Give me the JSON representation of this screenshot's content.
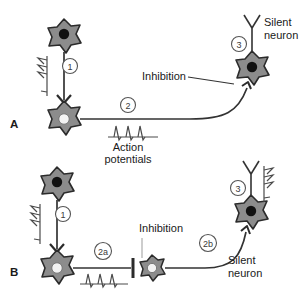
{
  "figure": {
    "background": "#ffffff",
    "width": 307,
    "height": 293
  },
  "colors": {
    "soma_fill": "#8c8c8c",
    "soma_stroke": "#2b2b2b",
    "nucleus_dark": "#111111",
    "nucleus_light": "#f2f2f2",
    "axon": "#333333",
    "trace": "#4a4a4a",
    "text": "#1a1a1a",
    "marker_circle": "#555555"
  },
  "panels": [
    {
      "id": "A",
      "label": "A",
      "markers": [
        {
          "id": "a1",
          "text": "1"
        },
        {
          "id": "a2",
          "text": "2"
        },
        {
          "id": "a3",
          "text": "3"
        }
      ],
      "labels": [
        {
          "id": "silent-neuron",
          "line1": "Silent",
          "line2": "neuron"
        },
        {
          "id": "inhibition",
          "text": "Inhibition"
        },
        {
          "id": "action-potentials",
          "line1": "Action",
          "line2": "potentials"
        }
      ],
      "neurons": [
        {
          "id": "neuron-1",
          "role": "presynaptic-excitatory",
          "nucleus": "dark"
        },
        {
          "id": "neuron-2",
          "role": "projection-neuron",
          "nucleus": "light"
        },
        {
          "id": "neuron-3",
          "role": "silent-neuron",
          "nucleus": "dark"
        }
      ],
      "traces": [
        {
          "id": "trace-vertical-1",
          "spikes": 3,
          "orientation": "vertical"
        },
        {
          "id": "trace-action-potentials",
          "spikes": 3,
          "orientation": "horizontal"
        }
      ]
    },
    {
      "id": "B",
      "label": "B",
      "markers": [
        {
          "id": "b1",
          "text": "1"
        },
        {
          "id": "b2a",
          "text": "2a"
        },
        {
          "id": "b2b",
          "text": "2b"
        },
        {
          "id": "b3",
          "text": "3"
        }
      ],
      "labels": [
        {
          "id": "inhibition",
          "text": "Inhibition"
        },
        {
          "id": "silent-neuron",
          "line1": "Silent",
          "line2": "neuron"
        }
      ],
      "neurons": [
        {
          "id": "neuron-1",
          "role": "presynaptic-excitatory",
          "nucleus": "dark"
        },
        {
          "id": "neuron-2",
          "role": "projection-neuron",
          "nucleus": "light"
        },
        {
          "id": "neuron-interneuron",
          "role": "inhibitory-interneuron",
          "nucleus": "light"
        },
        {
          "id": "neuron-3",
          "role": "silent-neuron",
          "nucleus": "dark"
        }
      ],
      "traces": [
        {
          "id": "trace-vertical-1",
          "spikes": 3,
          "orientation": "vertical"
        },
        {
          "id": "trace-action-potentials",
          "spikes": 3,
          "orientation": "horizontal"
        },
        {
          "id": "trace-vertical-3",
          "spikes": 3,
          "orientation": "vertical"
        }
      ]
    }
  ]
}
